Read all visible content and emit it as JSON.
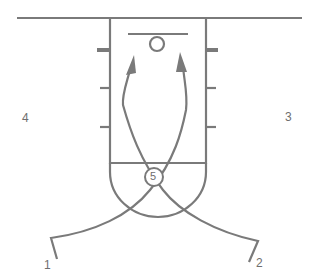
{
  "diagram": {
    "type": "basketball-play",
    "colors": {
      "lines": "#7a7a7a",
      "background": "#ffffff",
      "text": "#6e6e6e"
    },
    "players": [
      {
        "label": "1",
        "position": "left-wing-bottom"
      },
      {
        "label": "2",
        "position": "right-wing-bottom"
      },
      {
        "label": "3",
        "position": "right-wing"
      },
      {
        "label": "4",
        "position": "left-wing"
      },
      {
        "label": "5",
        "position": "high-post-circle"
      }
    ],
    "actions": [
      {
        "from": "1",
        "type": "cut",
        "path": "cross under free-throw circle to right block, toward basket"
      },
      {
        "from": "2",
        "type": "cut",
        "path": "cross under free-throw circle to left block, toward basket"
      }
    ]
  }
}
